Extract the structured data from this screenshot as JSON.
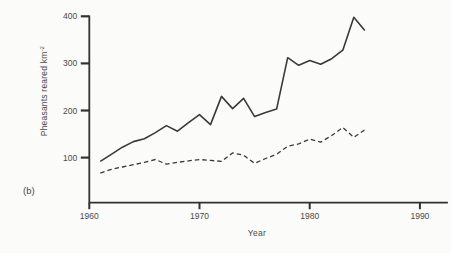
{
  "figure_label": "(b)",
  "colors": {
    "background": "#fbfbf9",
    "axis": "#323232",
    "line": "#3a3a3a",
    "text": "#4a4a4a"
  },
  "chart_data": {
    "type": "line",
    "title": "",
    "xlabel": "Year",
    "ylabel": "Pheasants reared km⁻²",
    "ylabel_main": "Pheasants reared km",
    "ylabel_sup": "-2",
    "x_ticks": [
      1960,
      1970,
      1980,
      1990
    ],
    "y_ticks": [
      100,
      200,
      300,
      400
    ],
    "xlim": [
      1960,
      1992.5
    ],
    "ylim": [
      0,
      400
    ],
    "grid": false,
    "legend": "none",
    "x": [
      1961,
      1962,
      1963,
      1964,
      1965,
      1966,
      1967,
      1968,
      1969,
      1970,
      1971,
      1972,
      1973,
      1974,
      1975,
      1976,
      1977,
      1978,
      1979,
      1980,
      1981,
      1982,
      1983,
      1984,
      1985
    ],
    "series": [
      {
        "name": "solid",
        "style": "solid",
        "color": "#3a3a3a",
        "values": [
          92,
          107,
          122,
          134,
          140,
          153,
          168,
          156,
          174,
          191,
          170,
          230,
          204,
          226,
          187,
          196,
          203,
          312,
          296,
          306,
          298,
          310,
          328,
          398,
          370
        ]
      },
      {
        "name": "dashed",
        "style": "dashed",
        "color": "#3a3a3a",
        "values": [
          67,
          75,
          80,
          85,
          90,
          96,
          86,
          90,
          93,
          96,
          94,
          92,
          110,
          105,
          88,
          98,
          107,
          124,
          129,
          139,
          133,
          147,
          164,
          143,
          159
        ]
      }
    ]
  }
}
